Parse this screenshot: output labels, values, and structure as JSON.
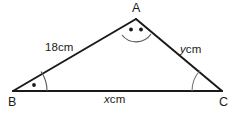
{
  "figure": {
    "type": "triangle-diagram",
    "stroke_color": "#1a1a1a",
    "arc_color": "#555555",
    "background_color": "#ffffff",
    "vertices": [
      {
        "id": "A",
        "label": "A",
        "x": 136,
        "y": 19
      },
      {
        "id": "B",
        "label": "B",
        "x": 13,
        "y": 91
      },
      {
        "id": "C",
        "label": "C",
        "x": 222,
        "y": 91
      }
    ],
    "sides": [
      {
        "id": "AB",
        "label_value": "18",
        "label_unit": "cm",
        "label_full": "18cm",
        "from": "B",
        "to": "A"
      },
      {
        "id": "AC",
        "label_value": "y",
        "label_unit": "cm",
        "label_full": "ycm",
        "from": "A",
        "to": "C"
      },
      {
        "id": "BC",
        "label_value": "x",
        "label_unit": "cm",
        "label_full": "xcm",
        "from": "B",
        "to": "C"
      }
    ],
    "angles": [
      {
        "at": "A",
        "marker": "arc-with-two-dots",
        "dots": 2
      },
      {
        "at": "B",
        "marker": "arc-with-one-dot",
        "dots": 1
      },
      {
        "at": "C",
        "marker": "plain-arc",
        "dots": 0
      }
    ]
  },
  "labels": {
    "vertex_a": "A",
    "vertex_b": "B",
    "vertex_c": "C",
    "side_ab_number": "18",
    "side_ab_unit": "cm",
    "side_ac_var": "y",
    "side_ac_unit": "cm",
    "side_bc_var": "x",
    "side_bc_unit": "cm"
  }
}
